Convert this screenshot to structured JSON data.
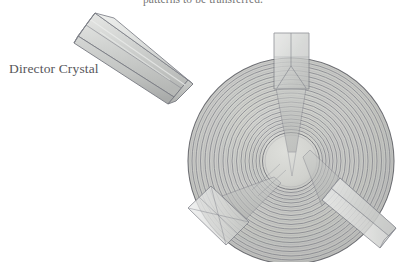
{
  "figure": {
    "domain": "Natural-Image",
    "background_color": "#ffffff",
    "caption_top": "patterns to be transferred.",
    "caption_top_note": "clipped by top edge of scan",
    "label_director_crystal": "Director Crystal",
    "label_text_color": "#56565a",
    "caption_text_color": "#6c6c6c"
  },
  "illustration": {
    "title": "Director Crystal and ringed disc",
    "disc": {
      "name": "ringed-disc",
      "center_x": 291,
      "center_y": 161,
      "outer_radius": 103,
      "hub_radius": 27,
      "ring_count": 19,
      "fill_color": "#c9cac6",
      "hub_color": "#d4d5d1",
      "stroke_color": "#84858a",
      "edge_color": "#74757a"
    },
    "crystals": [
      {
        "name": "crystal-top",
        "position": "top",
        "angle_deg": 90,
        "body_color": "#c6c8c6",
        "highlight_color": "#dcdddb",
        "edge_color": "#7e8086"
      },
      {
        "name": "crystal-bottom-left",
        "position": "bottom-left",
        "angle_deg": 215,
        "body_color": "#c6c8c6",
        "highlight_color": "#dcdddb",
        "edge_color": "#7e8086"
      },
      {
        "name": "crystal-bottom-right",
        "position": "bottom-right",
        "angle_deg": 325,
        "body_color": "#c6c8c6",
        "highlight_color": "#dcdddb",
        "edge_color": "#7e8086"
      },
      {
        "name": "crystal-director",
        "position": "upper-left-detached",
        "angle_deg": 0,
        "body_color": "#c9cbc9",
        "highlight_color": "#e0e1df",
        "edge_color": "#7e8086"
      }
    ]
  }
}
